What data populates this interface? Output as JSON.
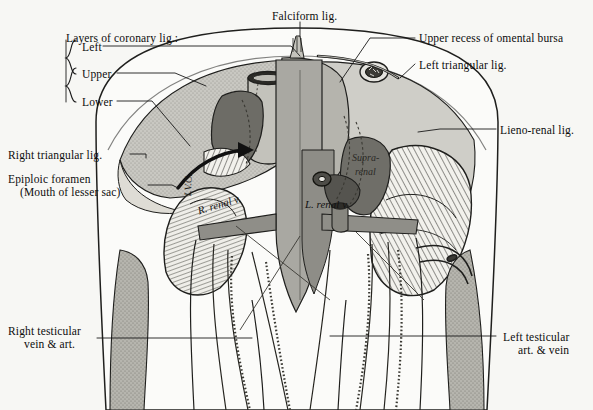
{
  "figure": {
    "title_partial": "",
    "background_color": "#f7f7f4",
    "ink_color": "#1a1a1a",
    "tones": {
      "liver_light": "#c9c8c2",
      "liver_mid": "#b0afa8",
      "dark_organ": "#6e6d68",
      "vessel_grey": "#9a9994",
      "pale": "#e9e8e3",
      "hatch": "#2a2a2a"
    }
  },
  "labels": {
    "coronary_heading": "Layers of coronary lig.:",
    "coronary_layers": [
      {
        "id": "left",
        "text": "Left"
      },
      {
        "id": "upper",
        "text": "Upper"
      },
      {
        "id": "lower",
        "text": "Lower"
      }
    ],
    "falciform": "Falciform lig.",
    "upper_recess": "Upper recess of omental bursa",
    "left_triangular": "Left triangular lig.",
    "lieno_renal": "Lieno-renal lig.",
    "right_triangular": "Right triangular lig.",
    "epiploic_line1": "Epiploic foramen",
    "epiploic_line2": "(Mouth of lesser sac)",
    "right_testicular_line1": "Right testicular",
    "right_testicular_line2": "vein & art.",
    "left_testicular_line1": "Left testicular",
    "left_testicular_line2": "art. & vein"
  },
  "inline_labels": {
    "r_renal_v": "R. renal v.",
    "l_renal_v": "L. renal v.",
    "suprarenal_line1": "Supra-",
    "suprarenal_line2": "renal",
    "ivc_vertical": "I.V.C."
  }
}
